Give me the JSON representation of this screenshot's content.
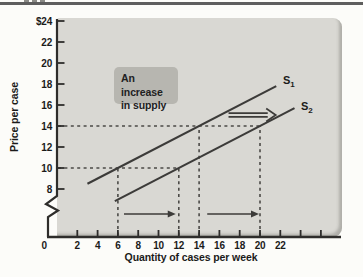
{
  "colors": {
    "top_rule": "#5e5e5e",
    "panel_bg": "#d9d8d3",
    "annotation_box_bg": "#b7b6b0",
    "axis": "#2e2d2b",
    "supply_line": "#3c3b39",
    "dashed_guide": "#4b4a47",
    "text": "#1b1b1a"
  },
  "figure": {
    "ylabel": "Price per case",
    "xlabel": "Quantity of cases per week",
    "origin_label": "0",
    "annotation_box": {
      "line1": "An increase",
      "line2": "in supply"
    },
    "series_labels": [
      {
        "base": "S",
        "sub": "1"
      },
      {
        "base": "S",
        "sub": "2"
      }
    ]
  },
  "chart_data": {
    "type": "line",
    "title": "An increase in supply",
    "xlabel": "Quantity of cases per week",
    "ylabel": "Price per case",
    "x_axis": {
      "min": 0,
      "max": 26,
      "ticks_labeled": [
        2,
        4,
        6,
        8,
        10,
        12,
        14,
        16,
        18,
        20,
        22
      ],
      "ticks_unlabeled": [
        24,
        26
      ]
    },
    "y_axis": {
      "broken_below": 8,
      "origin_label": "0",
      "ticks": [
        {
          "label": "$24",
          "value": 24
        },
        {
          "label": "22",
          "value": 22
        },
        {
          "label": "20",
          "value": 20
        },
        {
          "label": "18",
          "value": 18
        },
        {
          "label": "16",
          "value": 16
        },
        {
          "label": "14",
          "value": 14
        },
        {
          "label": "12",
          "value": 12
        },
        {
          "label": "10",
          "value": 10
        },
        {
          "label": "8",
          "value": 8
        }
      ]
    },
    "series": [
      {
        "name": "S1",
        "points": [
          [
            3,
            8.5
          ],
          [
            21.6,
            17.8
          ]
        ],
        "key_points": [
          [
            6,
            10
          ],
          [
            14,
            14
          ]
        ]
      },
      {
        "name": "S2",
        "points": [
          [
            5.7,
            6.85
          ],
          [
            23.4,
            15.7
          ]
        ],
        "key_points": [
          [
            12,
            10
          ],
          [
            20,
            14
          ]
        ]
      }
    ],
    "guides": [
      {
        "type": "h",
        "price": 14,
        "q_from": 0,
        "q_to": 20
      },
      {
        "type": "h",
        "price": 10,
        "q_from": 0,
        "q_to": 12
      },
      {
        "type": "v",
        "quantity": 6,
        "p_to": 10
      },
      {
        "type": "v",
        "quantity": 12,
        "p_to": 10
      },
      {
        "type": "v",
        "quantity": 14,
        "p_to": 14
      },
      {
        "type": "v",
        "quantity": 20,
        "p_to": 14
      }
    ],
    "arrows": [
      {
        "kind": "double-shaft",
        "q_from": 16.9,
        "q_to": 21.55,
        "price": 15.05
      },
      {
        "kind": "single",
        "q_from": 6.6,
        "q_to": 11.7,
        "y_px": 214
      },
      {
        "kind": "single",
        "q_from": 14.8,
        "q_to": 19.9,
        "y_px": 214
      }
    ],
    "style": {
      "axis_color": "#2e2d2b",
      "line_color": "#3c3b39",
      "dash_color": "#4b4a47"
    }
  }
}
